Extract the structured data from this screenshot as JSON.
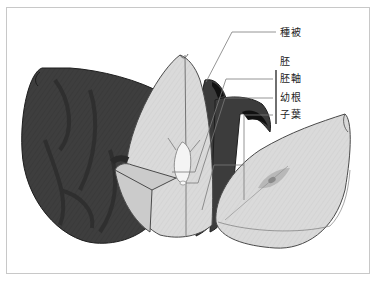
{
  "diagram": {
    "labels": {
      "seed_coat": "種被",
      "embryo": "胚",
      "hypocotyl": "胚軸",
      "radicle": "幼根",
      "cotyledon": "子葉"
    },
    "colors": {
      "seed_coat_dark": "#3c3c3c",
      "seed_coat_pattern": "#2c2c2c",
      "cotyledon_fill": "#d9d9d9",
      "cotyledon_shade": "#c6c6c6",
      "embryo_fill": "#f2f2f2",
      "outline": "#4a4a4a",
      "leader_line": "#7a7a7a",
      "bracket": "#333333",
      "frame": "#c8c8c8"
    }
  }
}
